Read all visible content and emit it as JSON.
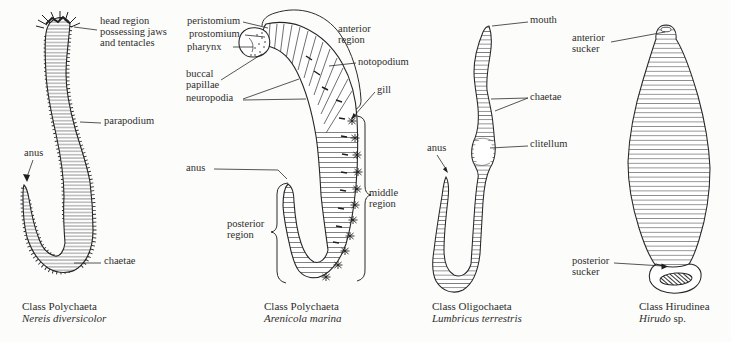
{
  "figure": {
    "background": "#fcfcfa",
    "ink": "#2b2b2b",
    "panels": [
      {
        "caption_class": "Class Polychaeta",
        "caption_species": "Nereis diversicolor",
        "caption_species_suffix": "",
        "labels": {
          "head_region1": "head region",
          "head_region2": "possessing jaws",
          "head_region3": "and tentacles",
          "parapodium": "parapodium",
          "anus": "anus",
          "chaetae": "chaetae"
        }
      },
      {
        "caption_class": "Class Polychaeta",
        "caption_species": "Arenicola marina",
        "caption_species_suffix": "",
        "labels": {
          "peristomium": "peristomium",
          "prostomium": "prostomium",
          "pharynx": "pharynx",
          "buccal1": "buccal",
          "buccal2": "papillae",
          "neuropodia": "neuropodia",
          "anterior1": "anterior",
          "anterior2": "region",
          "notopodium": "notopodium",
          "gill": "gill",
          "middle1": "middle",
          "middle2": "region",
          "anus": "anus",
          "posterior1": "posterior",
          "posterior2": "region"
        }
      },
      {
        "caption_class": "Class Oligochaeta",
        "caption_species": "Lumbricus terrestris",
        "caption_species_suffix": "",
        "labels": {
          "mouth": "mouth",
          "chaetae": "chaetae",
          "clitellum": "clitellum",
          "anus": "anus"
        }
      },
      {
        "caption_class": "Class Hirudinea",
        "caption_species": "Hirudo",
        "caption_species_suffix": " sp.",
        "labels": {
          "anterior1": "anterior",
          "anterior2": "sucker",
          "posterior1": "posterior",
          "posterior2": "sucker"
        }
      }
    ]
  }
}
